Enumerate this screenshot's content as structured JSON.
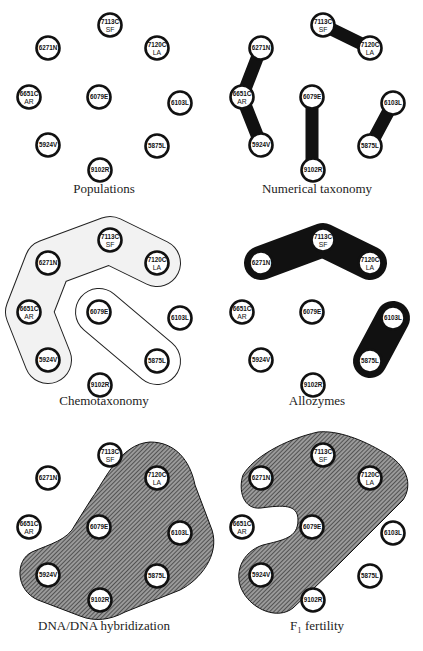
{
  "nodes": [
    {
      "id": "7113C",
      "line1": "7113C",
      "line2": "SF",
      "x": 110,
      "y": 25
    },
    {
      "id": "6271N",
      "line1": "6271N",
      "line2": "",
      "x": 48,
      "y": 48
    },
    {
      "id": "7120C",
      "line1": "7120C",
      "line2": "LA",
      "x": 157,
      "y": 48
    },
    {
      "id": "6651C",
      "line1": "6651C",
      "line2": "AR",
      "x": 29,
      "y": 97
    },
    {
      "id": "6079E",
      "line1": "6079E",
      "line2": "",
      "x": 99,
      "y": 97
    },
    {
      "id": "6103L",
      "line1": "6103L",
      "line2": "",
      "x": 180,
      "y": 103
    },
    {
      "id": "5924V",
      "line1": "5924V",
      "line2": "",
      "x": 48,
      "y": 145
    },
    {
      "id": "5875L",
      "line1": "5875L",
      "line2": "",
      "x": 157,
      "y": 146
    },
    {
      "id": "9102R",
      "line1": "9102R",
      "line2": "",
      "x": 100,
      "y": 170
    }
  ],
  "panels": [
    {
      "key": "populations",
      "title": "Populations",
      "dx": 0,
      "dy": 0,
      "title_y": 193
    },
    {
      "key": "numerical-taxonomy",
      "title": "Numerical taxonomy",
      "dx": 213,
      "dy": 0,
      "title_y": 193,
      "groups": [
        [
          "7113C",
          "7120C"
        ],
        [
          "6271N",
          "6651C",
          "5924V"
        ],
        [
          "6079E",
          "9102R"
        ],
        [
          "6103L",
          "5875L"
        ]
      ]
    },
    {
      "key": "chemotaxonomy",
      "title": "Chemotaxonomy",
      "dx": 0,
      "dy": 215,
      "title_y": 405,
      "groups": [
        [
          "7120C",
          "7113C",
          "6271N",
          "6651C",
          "5924V"
        ],
        [
          "6079E",
          "5875L"
        ]
      ]
    },
    {
      "key": "allozymes",
      "title": "Allozymes",
      "dx": 213,
      "dy": 215,
      "title_y": 405,
      "groups": [
        [
          "6271N",
          "7113C",
          "7120C"
        ],
        [
          "6103L",
          "5875L"
        ]
      ]
    },
    {
      "key": "dna-dna-hybridization",
      "title": "DNA/DNA hybridization",
      "dx": 0,
      "dy": 430,
      "title_y": 630,
      "groups": [
        [
          "7120C",
          "6079E",
          "6103L",
          "5875L",
          "9102R",
          "5924V"
        ]
      ]
    },
    {
      "key": "f1-fertility",
      "title": "F₁ fertility",
      "dx": 213,
      "dy": 430,
      "title_y": 630,
      "groups": [
        [
          "6271N",
          "7113C",
          "7120C",
          "6079E",
          "5924V"
        ]
      ]
    }
  ],
  "colors": {
    "ink": "#111111",
    "chemo_fill": "#f2f2f2",
    "hatch_bg": "#8a8a8a"
  }
}
